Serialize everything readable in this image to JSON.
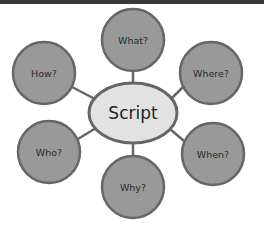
{
  "diagram": {
    "type": "mind-map",
    "center": {
      "label": "Script",
      "cx": 133,
      "cy": 113,
      "rx": 44,
      "ry": 30,
      "fill": "#e2e2e2",
      "stroke": "#666666"
    },
    "nodes": [
      {
        "id": "what",
        "label": "What?",
        "cx": 133,
        "cy": 40,
        "r": 31
      },
      {
        "id": "how",
        "label": "How?",
        "cx": 44,
        "cy": 73,
        "r": 31
      },
      {
        "id": "where",
        "label": "Where?",
        "cx": 211,
        "cy": 73,
        "r": 31
      },
      {
        "id": "who",
        "label": "Who?",
        "cx": 49,
        "cy": 152,
        "r": 31
      },
      {
        "id": "when",
        "label": "When?",
        "cx": 213,
        "cy": 154,
        "r": 31
      },
      {
        "id": "why",
        "label": "Why?",
        "cx": 133,
        "cy": 187,
        "r": 31
      }
    ],
    "colors": {
      "node_fill": "#999999",
      "node_stroke": "#666666",
      "connector": "#666666",
      "topbar": "#3a3a3a"
    }
  }
}
